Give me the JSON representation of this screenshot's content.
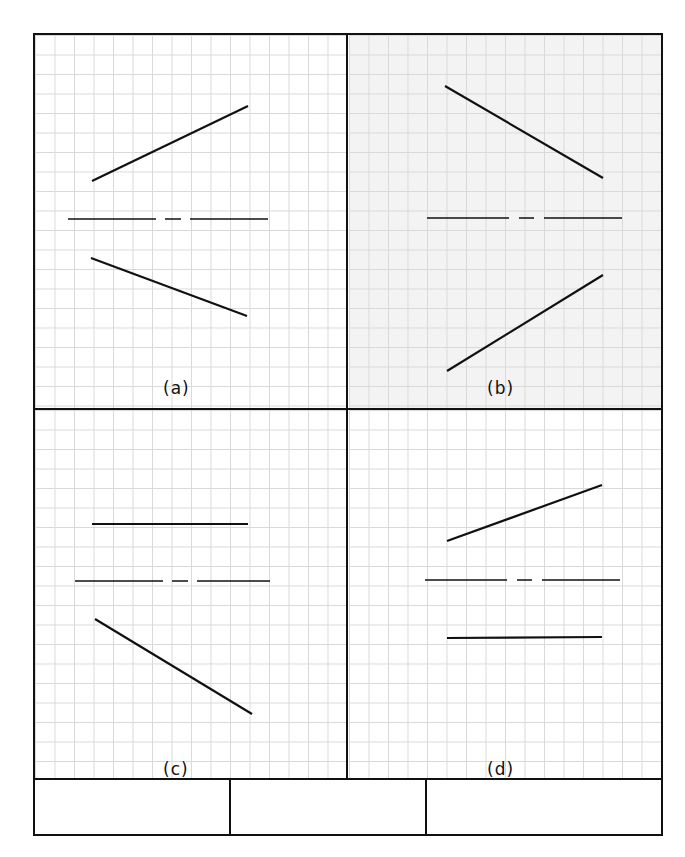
{
  "panels": [
    {
      "id": "a",
      "label": "(a)",
      "shaded": false,
      "lines": [
        {
          "role": "upper-line",
          "x1": 92,
          "y1": 181,
          "x2": 248,
          "y2": 106,
          "style": "solid"
        },
        {
          "role": "axis",
          "x1": 68,
          "y1": 219,
          "x2": 268,
          "y2": 219,
          "style": "dash-dot"
        },
        {
          "role": "lower-line",
          "x1": 91,
          "y1": 258,
          "x2": 247,
          "y2": 316,
          "style": "solid"
        }
      ]
    },
    {
      "id": "b",
      "label": "(b)",
      "shaded": true,
      "lines": [
        {
          "role": "upper-line",
          "x1": 445,
          "y1": 86,
          "x2": 603,
          "y2": 178,
          "style": "solid"
        },
        {
          "role": "axis",
          "x1": 427,
          "y1": 218,
          "x2": 622,
          "y2": 218,
          "style": "dash-dot"
        },
        {
          "role": "lower-line",
          "x1": 447,
          "y1": 371,
          "x2": 603,
          "y2": 275,
          "style": "solid"
        }
      ]
    },
    {
      "id": "c",
      "label": "(c)",
      "shaded": false,
      "lines": [
        {
          "role": "upper-line",
          "x1": 92,
          "y1": 524,
          "x2": 248,
          "y2": 524,
          "style": "solid"
        },
        {
          "role": "axis",
          "x1": 75,
          "y1": 581,
          "x2": 270,
          "y2": 581,
          "style": "dash-dot"
        },
        {
          "role": "lower-line",
          "x1": 95,
          "y1": 619,
          "x2": 252,
          "y2": 714,
          "style": "solid"
        }
      ]
    },
    {
      "id": "d",
      "label": "(d)",
      "shaded": false,
      "lines": [
        {
          "role": "upper-line",
          "x1": 447,
          "y1": 541,
          "x2": 602,
          "y2": 485,
          "style": "solid"
        },
        {
          "role": "axis",
          "x1": 425,
          "y1": 580,
          "x2": 620,
          "y2": 580,
          "style": "dash-dot"
        },
        {
          "role": "lower-line",
          "x1": 447,
          "y1": 638,
          "x2": 602,
          "y2": 637,
          "style": "solid"
        }
      ]
    }
  ],
  "title_block": {
    "cells": [
      "",
      "",
      ""
    ]
  },
  "colors": {
    "line": "#111111",
    "grid": "#d9d9d9",
    "shaded_panel": "#f3f3f3"
  }
}
